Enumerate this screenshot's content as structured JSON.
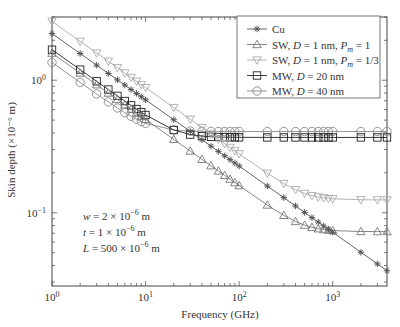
{
  "chart_data": {
    "type": "line",
    "title": "",
    "xlabel": "Frequency (GHz)",
    "ylabel": "Skin depth (×10⁻⁶ m)",
    "xscale": "log",
    "yscale": "log",
    "xlim": [
      1,
      3800
    ],
    "ylim": [
      0.028,
      3.0
    ],
    "grid": false,
    "legend_position": "upper right",
    "x_ticks": [
      {
        "value": 1,
        "base": "10",
        "exp": "0"
      },
      {
        "value": 10,
        "base": "10",
        "exp": "1"
      },
      {
        "value": 100,
        "base": "10",
        "exp": "2"
      },
      {
        "value": 1000,
        "base": "10",
        "exp": "3"
      }
    ],
    "y_ticks": [
      {
        "value": 1,
        "base": "10",
        "exp": "0"
      },
      {
        "value": 0.1,
        "base": "10",
        "exp": "−1"
      }
    ],
    "x": [
      1,
      2,
      3,
      4,
      5,
      6,
      7,
      8,
      9,
      10,
      20,
      30,
      40,
      50,
      60,
      70,
      80,
      90,
      100,
      200,
      300,
      400,
      500,
      600,
      700,
      800,
      900,
      1000,
      2000,
      3000,
      3800
    ],
    "series": [
      {
        "name": "Cu",
        "marker": "asterisk",
        "color": "#555555",
        "amp": 2.25,
        "floor": 0
      },
      {
        "name": "SW, D = 1 nm, Pm = 1",
        "marker": "triangle-up",
        "color": "#777777",
        "amp": 1.6,
        "floor": 0.072
      },
      {
        "name": "SW, D = 1 nm, Pm = 1/3",
        "marker": "triangle-down",
        "color": "#aaaaaa",
        "amp": 2.78,
        "floor": 0.125
      },
      {
        "name": "MW, D = 20 nm",
        "marker": "square",
        "color": "#222222",
        "amp": 1.7,
        "floor": 0.37
      },
      {
        "name": "MW, D = 40 nm",
        "marker": "circle",
        "color": "#888888",
        "amp": 1.36,
        "floor": 0.41
      }
    ],
    "legend": [
      {
        "pre": "Cu",
        "d": "",
        "mid": "",
        "pm": "",
        "post": ""
      },
      {
        "pre": "SW, ",
        "d": "D",
        "mid": " = 1 nm, ",
        "pm": "P",
        "sub": "m",
        "post": " = 1"
      },
      {
        "pre": "SW, ",
        "d": "D",
        "mid": " = 1 nm, ",
        "pm": "P",
        "sub": "m",
        "post": " = 1/3"
      },
      {
        "pre": "MW, ",
        "d": "D",
        "mid": " = 20 nm",
        "pm": "",
        "post": ""
      },
      {
        "pre": "MW, ",
        "d": "D",
        "mid": " = 40 nm",
        "pm": "",
        "post": ""
      }
    ],
    "annotations": [
      {
        "var": "w",
        "text": " = 2 × 10",
        "exp": "−6",
        "unit": " m"
      },
      {
        "var": "t",
        "text": " = 1 × 10",
        "exp": "−6",
        "unit": " m"
      },
      {
        "var": "L",
        "text": " = 500 × 10",
        "exp": "−6",
        "unit": " m"
      }
    ]
  }
}
